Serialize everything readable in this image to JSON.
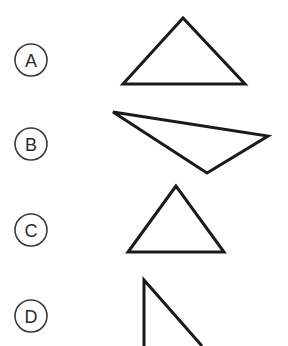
{
  "figure": {
    "background_color": "#ffffff",
    "width": 288,
    "height": 346,
    "stroke_color": "#1a1a1a",
    "label_color": "#2b2b2b",
    "label_circle_color": "#3a3a3a"
  },
  "options": [
    {
      "id": "a",
      "label": "A",
      "circle": {
        "cx": 31,
        "cy": 60,
        "r": 16
      },
      "shape": {
        "name": "wide-obtuse-triangle",
        "kind": "triangle",
        "clipped": false,
        "points": "183,18 123,84 245,84"
      }
    },
    {
      "id": "b",
      "label": "B",
      "circle": {
        "cx": 31,
        "cy": 144,
        "r": 16
      },
      "shape": {
        "name": "downward-scalene-triangle",
        "kind": "triangle",
        "clipped": false,
        "points": "113,112 268,136 207,173"
      }
    },
    {
      "id": "c",
      "label": "C",
      "circle": {
        "cx": 31,
        "cy": 230,
        "r": 16
      },
      "shape": {
        "name": "upright-isosceles-triangle",
        "kind": "triangle",
        "clipped": false,
        "points": "176,186 128,252 224,252"
      }
    },
    {
      "id": "d",
      "label": "D",
      "circle": {
        "cx": 31,
        "cy": 316,
        "r": 16
      },
      "shape": {
        "name": "right-triangle-cropped",
        "kind": "triangle",
        "clipped": true,
        "points": "144,346 144,280 202,346"
      }
    }
  ]
}
